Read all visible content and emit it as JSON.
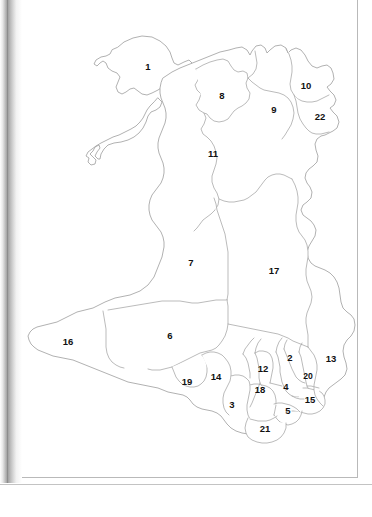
{
  "page": {
    "caption": "",
    "background_color": "#ffffff",
    "outline_color": "#9d9d9d",
    "label_color": "#111111",
    "gutter_color": "#9b9b9b",
    "page_border_color": "#b9b9b9",
    "width": 372,
    "height": 517
  },
  "map": {
    "name": "wales-unitary-authorities-outline",
    "region_count": 22,
    "regions": [
      {
        "id": 1,
        "label": "1",
        "x": 148,
        "y": 67,
        "size": "md"
      },
      {
        "id": 8,
        "label": "8",
        "x": 222,
        "y": 96,
        "size": "md"
      },
      {
        "id": 10,
        "label": "10",
        "x": 306,
        "y": 86,
        "size": "md"
      },
      {
        "id": 9,
        "label": "9",
        "x": 274,
        "y": 110,
        "size": "md"
      },
      {
        "id": 22,
        "label": "22",
        "x": 320,
        "y": 117,
        "size": "md"
      },
      {
        "id": 11,
        "label": "11",
        "x": 213,
        "y": 154,
        "size": "md"
      },
      {
        "id": 7,
        "label": "7",
        "x": 191,
        "y": 263,
        "size": "md"
      },
      {
        "id": 17,
        "label": "17",
        "x": 274,
        "y": 271,
        "size": "md"
      },
      {
        "id": 16,
        "label": "16",
        "x": 68,
        "y": 342,
        "size": "md"
      },
      {
        "id": 6,
        "label": "6",
        "x": 170,
        "y": 336,
        "size": "md"
      },
      {
        "id": 13,
        "label": "13",
        "x": 331,
        "y": 359,
        "size": "md"
      },
      {
        "id": 2,
        "label": "2",
        "x": 290,
        "y": 358,
        "size": "md"
      },
      {
        "id": 12,
        "label": "12",
        "x": 263,
        "y": 369,
        "size": "md"
      },
      {
        "id": 20,
        "label": "20",
        "x": 308,
        "y": 376,
        "size": "sm"
      },
      {
        "id": 14,
        "label": "14",
        "x": 216,
        "y": 377,
        "size": "md"
      },
      {
        "id": 19,
        "label": "19",
        "x": 187,
        "y": 382,
        "size": "md"
      },
      {
        "id": 18,
        "label": "18",
        "x": 260,
        "y": 390,
        "size": "md"
      },
      {
        "id": 4,
        "label": "4",
        "x": 286,
        "y": 387,
        "size": "md"
      },
      {
        "id": 15,
        "label": "15",
        "x": 310,
        "y": 400,
        "size": "md"
      },
      {
        "id": 3,
        "label": "3",
        "x": 232,
        "y": 405,
        "size": "md"
      },
      {
        "id": 5,
        "label": "5",
        "x": 288,
        "y": 411,
        "size": "md"
      },
      {
        "id": 21,
        "label": "21",
        "x": 265,
        "y": 429,
        "size": "md"
      }
    ]
  }
}
